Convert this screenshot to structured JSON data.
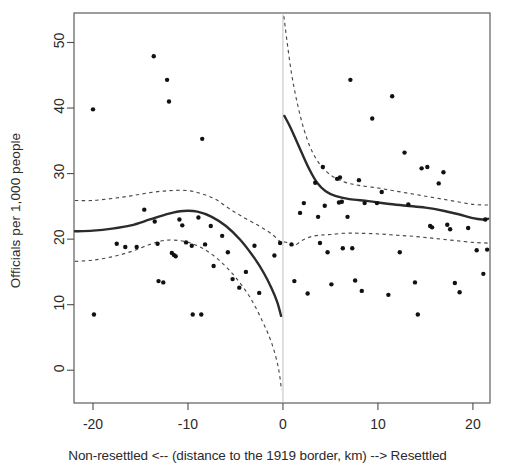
{
  "figure": {
    "ylabel": "Officials per 1,000 people",
    "xcaption": "Non-resettled <-- (distance to the 1919 border, km) --> Resettled"
  },
  "chart_data": {
    "type": "scatter",
    "title": "",
    "xlabel": "Non-resettled <-- (distance to the 1919 border, km) --> Resettled",
    "ylabel": "Officials per 1,000 people",
    "xlim": [
      -22.0,
      21.8
    ],
    "ylim": [
      -5.0,
      54.5
    ],
    "xticks": [
      -20,
      -10,
      0,
      10,
      20
    ],
    "xticklabels": [
      "-20",
      "-10",
      "0",
      "10",
      "20"
    ],
    "yticks": [
      0,
      10,
      20,
      30,
      40,
      50
    ],
    "yticklabels": [
      "0",
      "10",
      "20",
      "30",
      "40",
      "50"
    ],
    "grid": false,
    "legend": null,
    "cutoff_line": {
      "x": 0,
      "style": "thin-solid-grey"
    },
    "points": [
      [
        -20.0,
        39.8
      ],
      [
        -19.9,
        8.5
      ],
      [
        -17.5,
        19.3
      ],
      [
        -16.6,
        18.8
      ],
      [
        -15.4,
        18.8
      ],
      [
        -14.6,
        24.5
      ],
      [
        -13.6,
        47.9
      ],
      [
        -13.5,
        22.7
      ],
      [
        -13.2,
        19.3
      ],
      [
        -13.1,
        13.6
      ],
      [
        -12.6,
        13.4
      ],
      [
        -12.2,
        44.3
      ],
      [
        -12.0,
        41.0
      ],
      [
        -11.7,
        17.9
      ],
      [
        -11.5,
        17.6
      ],
      [
        -11.3,
        17.4
      ],
      [
        -10.9,
        23.0
      ],
      [
        -10.6,
        22.1
      ],
      [
        -10.2,
        19.5
      ],
      [
        -9.6,
        19.0
      ],
      [
        -9.5,
        8.5
      ],
      [
        -8.9,
        23.3
      ],
      [
        -8.6,
        8.5
      ],
      [
        -8.5,
        35.3
      ],
      [
        -8.2,
        19.2
      ],
      [
        -7.6,
        22.0
      ],
      [
        -7.3,
        15.9
      ],
      [
        -6.4,
        20.5
      ],
      [
        -5.8,
        18.0
      ],
      [
        -5.3,
        13.9
      ],
      [
        -4.6,
        12.6
      ],
      [
        -3.9,
        15.0
      ],
      [
        -3.0,
        19.0
      ],
      [
        -2.5,
        11.8
      ],
      [
        -0.9,
        17.5
      ],
      [
        -0.3,
        19.4
      ],
      [
        0.9,
        19.2
      ],
      [
        1.2,
        13.6
      ],
      [
        1.8,
        24.0
      ],
      [
        2.2,
        25.5
      ],
      [
        2.6,
        11.7
      ],
      [
        3.4,
        28.6
      ],
      [
        3.7,
        23.4
      ],
      [
        3.9,
        19.4
      ],
      [
        4.2,
        31.0
      ],
      [
        4.4,
        25.1
      ],
      [
        4.7,
        18.0
      ],
      [
        5.1,
        13.1
      ],
      [
        5.7,
        29.2
      ],
      [
        5.9,
        25.6
      ],
      [
        6.0,
        29.4
      ],
      [
        6.2,
        25.7
      ],
      [
        6.3,
        18.6
      ],
      [
        6.8,
        23.4
      ],
      [
        7.1,
        44.3
      ],
      [
        7.3,
        18.6
      ],
      [
        7.6,
        13.7
      ],
      [
        8.0,
        29.0
      ],
      [
        8.3,
        12.1
      ],
      [
        8.6,
        25.5
      ],
      [
        9.4,
        38.4
      ],
      [
        9.9,
        25.5
      ],
      [
        10.4,
        27.2
      ],
      [
        11.1,
        11.5
      ],
      [
        11.5,
        41.8
      ],
      [
        12.3,
        18.0
      ],
      [
        12.8,
        33.2
      ],
      [
        13.2,
        25.3
      ],
      [
        13.9,
        13.4
      ],
      [
        14.2,
        8.5
      ],
      [
        14.6,
        30.8
      ],
      [
        15.2,
        31.0
      ],
      [
        15.5,
        22.0
      ],
      [
        15.7,
        21.8
      ],
      [
        16.4,
        28.5
      ],
      [
        16.9,
        30.2
      ],
      [
        17.3,
        22.2
      ],
      [
        17.6,
        21.5
      ],
      [
        18.1,
        13.3
      ],
      [
        18.6,
        11.9
      ],
      [
        19.5,
        21.7
      ],
      [
        20.4,
        18.3
      ],
      [
        21.1,
        14.7
      ],
      [
        21.3,
        23.0
      ],
      [
        21.5,
        18.4
      ]
    ],
    "series": [
      {
        "name": "fit-left",
        "style": "solid",
        "x": [
          -21.9,
          -20.0,
          -18.0,
          -16.0,
          -14.0,
          -12.0,
          -10.5,
          -9.0,
          -7.5,
          -6.0,
          -4.5,
          -3.0,
          -2.0,
          -1.2,
          -0.6,
          -0.2
        ],
        "y": [
          21.2,
          21.3,
          21.6,
          22.1,
          23.0,
          23.9,
          24.3,
          24.2,
          23.4,
          22.0,
          19.9,
          17.1,
          14.8,
          12.5,
          10.4,
          8.3
        ]
      },
      {
        "name": "ci-upper-left",
        "style": "dashed",
        "x": [
          -21.9,
          -20.0,
          -18.0,
          -16.0,
          -14.0,
          -12.0,
          -10.0,
          -8.5,
          -7.0,
          -5.5,
          -4.0,
          -2.5,
          -1.2,
          -0.3
        ],
        "y": [
          25.9,
          25.9,
          26.2,
          26.6,
          27.1,
          27.4,
          27.4,
          26.9,
          26.0,
          24.5,
          23.2,
          22.0,
          20.8,
          19.6
        ]
      },
      {
        "name": "ci-lower-left",
        "style": "dashed",
        "x": [
          -21.9,
          -20.0,
          -18.0,
          -16.0,
          -14.0,
          -12.5,
          -11.0,
          -9.5,
          -8.0,
          -6.5,
          -5.0,
          -3.5,
          -2.2,
          -1.2,
          -0.5,
          -0.15
        ],
        "y": [
          16.6,
          16.8,
          17.3,
          18.1,
          19.2,
          19.8,
          19.8,
          19.3,
          18.2,
          16.5,
          14.2,
          11.2,
          7.6,
          4.2,
          0.5,
          -3.0
        ]
      },
      {
        "name": "fit-right",
        "style": "solid",
        "x": [
          0.15,
          0.7,
          1.3,
          2.0,
          2.8,
          3.6,
          4.5,
          5.5,
          7.0,
          9.0,
          11.0,
          13.0,
          15.0,
          17.0,
          18.5,
          20.0,
          21.0,
          21.6
        ],
        "y": [
          38.8,
          37.3,
          35.4,
          33.1,
          30.6,
          28.6,
          27.3,
          26.6,
          26.1,
          25.8,
          25.4,
          25.1,
          24.8,
          24.3,
          23.8,
          23.2,
          23.0,
          23.1
        ]
      },
      {
        "name": "ci-upper-right",
        "style": "dashed",
        "x": [
          0.1,
          0.4,
          0.9,
          1.5,
          2.2,
          3.0,
          4.0,
          5.2,
          6.5,
          8.0,
          10.0,
          12.0,
          14.0,
          16.0,
          18.0,
          20.0,
          21.6
        ],
        "y": [
          54.0,
          50.5,
          45.3,
          40.8,
          36.8,
          33.6,
          31.2,
          29.6,
          28.7,
          28.2,
          27.8,
          27.3,
          26.8,
          26.3,
          25.8,
          25.3,
          25.2
        ]
      },
      {
        "name": "ci-lower-right",
        "style": "dashed",
        "x": [
          0.1,
          0.6,
          1.2,
          1.9,
          2.8,
          3.8,
          5.0,
          6.5,
          8.0,
          10.0,
          12.0,
          14.0,
          16.0,
          18.0,
          20.0,
          21.6
        ],
        "y": [
          19.6,
          19.4,
          19.0,
          19.7,
          20.3,
          20.6,
          20.7,
          20.9,
          20.9,
          20.8,
          20.6,
          20.4,
          20.1,
          19.8,
          19.5,
          19.4
        ]
      }
    ]
  }
}
